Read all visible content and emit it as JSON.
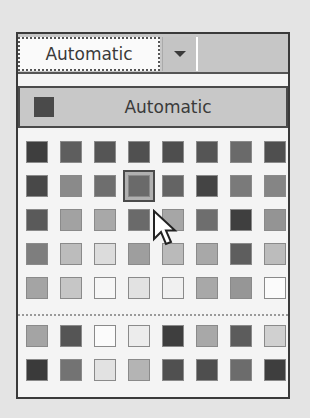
{
  "combo": {
    "value": "Automatic",
    "dropdown_icon": "chevron-down-icon"
  },
  "automatic_option": {
    "label": "Automatic",
    "swatch_color": "#4a4a4a"
  },
  "colors": {
    "standard": [
      [
        "#3e3e3e",
        "#5e5e5e",
        "#555555",
        "#505050",
        "#4e4e4e",
        "#555555",
        "#6a6a6a",
        "#4f4f4f"
      ],
      [
        "#484848",
        "#8a8a8a",
        "#6e6e6e",
        "#6a6a6a",
        "#646464",
        "#444444",
        "#7a7a7a",
        "#858585"
      ],
      [
        "#5a5a5a",
        "#a2a2a2",
        "#a8a8a8",
        "#6a6a6a",
        "#a6a6a6",
        "#6e6e6e",
        "#3f3f3f",
        "#949494"
      ],
      [
        "#7e7e7e",
        "#bcbcbc",
        "#dcdcdc",
        "#9e9e9e",
        "#bababa",
        "#a8a8a8",
        "#5e5e5e",
        "#bcbcbc"
      ],
      [
        "#a4a4a4",
        "#c6c6c6",
        "#f6f6f6",
        "#e2e2e2",
        "#f0f0f0",
        "#a8a8a8",
        "#969696",
        "#fbfbfb"
      ]
    ],
    "custom": [
      [
        "#a4a4a4",
        "#555555",
        "#fbfbfb",
        "#ececec",
        "#3e3e3e",
        "#a8a8a8",
        "#5c5c5c",
        "#d0d0d0"
      ],
      [
        "#3a3a3a",
        "#737373",
        "#e2e2e2",
        "#b4b4b4",
        "#505050",
        "#4e4e4e",
        "#6c6c6c",
        "#3e3e3e"
      ]
    ],
    "selected": {
      "row": 1,
      "col": 3
    }
  }
}
